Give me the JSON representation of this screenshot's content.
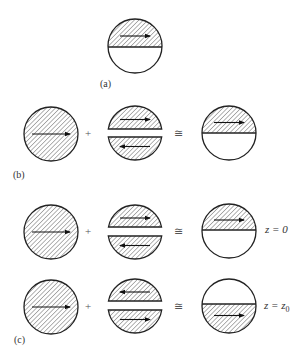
{
  "figure": {
    "stroke_color": "#222222",
    "hatch_color": "#555555",
    "background": "#ffffff",
    "radius": 27
  },
  "panels": {
    "a": {
      "label": "(a)",
      "label_pos": [
        100,
        87
      ],
      "elements": [
        {
          "type": "half",
          "cx": 135,
          "cy": 46,
          "line_y": 47,
          "hatched": "top",
          "arrow_dir": "right"
        }
      ]
    },
    "b": {
      "label": "(b)",
      "label_pos": [
        13,
        178
      ],
      "elements": [
        {
          "type": "full",
          "cx": 51,
          "cy": 134,
          "arrow_dir": "right"
        },
        {
          "type": "op",
          "x": 88,
          "y": 137,
          "text": "+"
        },
        {
          "type": "split",
          "cx": 135,
          "cy": 133,
          "gap_top": 129,
          "gap_bottom": 137,
          "top_arrow": "right",
          "bottom_arrow": "left"
        },
        {
          "type": "op",
          "x": 178,
          "y": 137,
          "text": "≅"
        },
        {
          "type": "half",
          "cx": 229,
          "cy": 133,
          "line_y": 133,
          "hatched": "top",
          "arrow_dir": "right"
        }
      ]
    },
    "c": {
      "label": "(c)",
      "label_pos": [
        14,
        343
      ],
      "rows": [
        {
          "equation": "z = 0",
          "equation_pos": [
            265,
            233
          ],
          "elements": [
            {
              "type": "full",
              "cx": 51,
              "cy": 232,
              "arrow_dir": "right"
            },
            {
              "type": "op",
              "x": 88,
              "y": 235,
              "text": "+"
            },
            {
              "type": "split",
              "cx": 135,
              "cy": 232,
              "gap_top": 227,
              "gap_bottom": 236,
              "top_arrow": "right",
              "bottom_arrow": "left"
            },
            {
              "type": "op",
              "x": 178,
              "y": 235,
              "text": "≅"
            },
            {
              "type": "half",
              "cx": 229,
              "cy": 231,
              "line_y": 230,
              "hatched": "top",
              "arrow_dir": "right"
            }
          ]
        },
        {
          "equation": "z = z",
          "equation_sub": "0",
          "equation_pos": [
            264,
            309
          ],
          "elements": [
            {
              "type": "full",
              "cx": 51,
              "cy": 307,
              "arrow_dir": "right"
            },
            {
              "type": "op",
              "x": 88,
              "y": 310,
              "text": "+"
            },
            {
              "type": "split",
              "cx": 135,
              "cy": 306,
              "gap_top": 301,
              "gap_bottom": 310,
              "top_arrow": "left",
              "bottom_arrow": "right"
            },
            {
              "type": "op",
              "x": 178,
              "y": 310,
              "text": "≅"
            },
            {
              "type": "half",
              "cx": 229,
              "cy": 306,
              "line_y": 304,
              "hatched": "bottom",
              "arrow_dir": "right"
            }
          ]
        }
      ]
    }
  }
}
